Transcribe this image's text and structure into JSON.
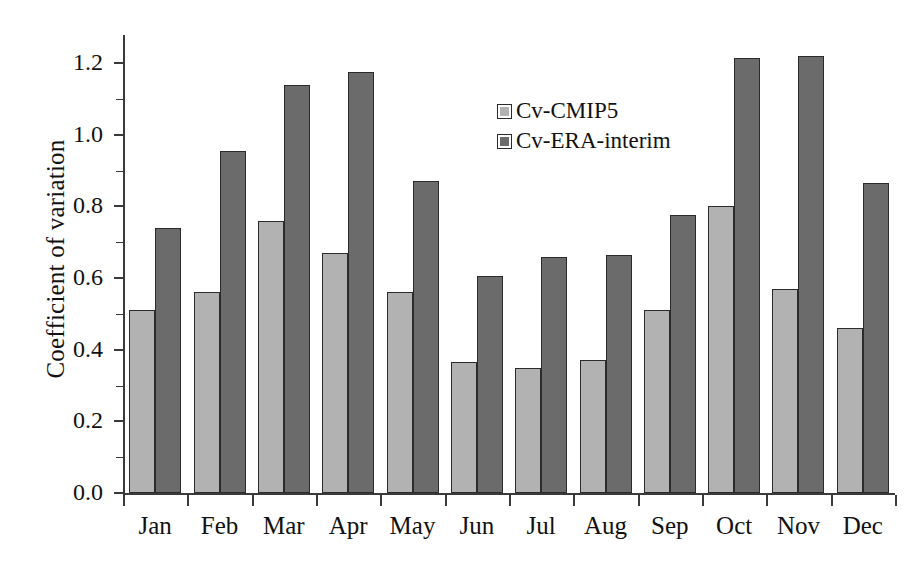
{
  "chart_data": {
    "type": "bar",
    "title": "",
    "xlabel": "",
    "ylabel": "Coefficient of variation",
    "categories": [
      "Jan",
      "Feb",
      "Mar",
      "Apr",
      "May",
      "Jun",
      "Jul",
      "Aug",
      "Sep",
      "Oct",
      "Nov",
      "Dec"
    ],
    "series": [
      {
        "name": "Cv-CMIP5",
        "color": "#b2b2b2",
        "values": [
          0.51,
          0.56,
          0.76,
          0.67,
          0.56,
          0.365,
          0.35,
          0.37,
          0.51,
          0.8,
          0.57,
          0.46
        ]
      },
      {
        "name": "Cv-ERA-interim",
        "color": "#6b6b6b",
        "values": [
          0.74,
          0.955,
          1.14,
          1.175,
          0.87,
          0.605,
          0.66,
          0.665,
          0.775,
          1.215,
          1.22,
          0.865
        ]
      }
    ],
    "ylim": [
      0.0,
      1.2
    ],
    "ytick_labels": [
      "0.0",
      "0.2",
      "0.4",
      "0.6",
      "0.8",
      "1.0",
      "1.2"
    ],
    "ytick_values": [
      0.0,
      0.2,
      0.4,
      0.6,
      0.8,
      1.0,
      1.2
    ],
    "yminor_values": [
      0.1,
      0.3,
      0.5,
      0.7,
      0.9,
      1.1
    ],
    "grid": false,
    "legend_position": "inside-upper-center",
    "axis_color": "#3a3a3a",
    "bar_edge_color": "#2b2b2b",
    "background": "#ffffff"
  },
  "legend": {
    "entries": [
      {
        "label": "Cv-CMIP5",
        "color": "#b2b2b2"
      },
      {
        "label": "Cv-ERA-interim",
        "color": "#6b6b6b"
      }
    ]
  }
}
